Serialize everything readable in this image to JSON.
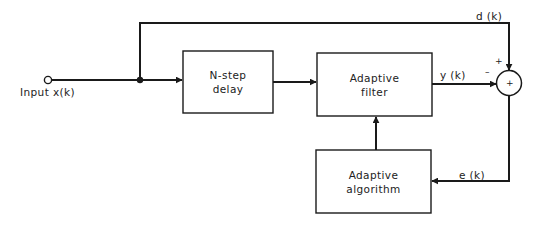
{
  "diagram": {
    "type": "block-diagram",
    "colors": {
      "stroke": "#1a1a1a",
      "background": "#ffffff",
      "text": "#222222"
    },
    "input": {
      "label": "Input x(k)"
    },
    "blocks": [
      {
        "id": "delay",
        "line1": "N-step",
        "line2": "delay"
      },
      {
        "id": "filter",
        "line1": "Adaptive",
        "line2": "filter"
      },
      {
        "id": "algorithm",
        "line1": "Adaptive",
        "line2": "algorithm"
      }
    ],
    "signals": {
      "desired": "d (k)",
      "output": "y (k)",
      "error": "e (k)"
    },
    "summing_junction": {
      "center_symbol": "+",
      "plus_sign": "+",
      "minus_sign": "–"
    },
    "edges": [
      {
        "from": "input",
        "to": "delay"
      },
      {
        "from": "input",
        "to": "summing_junction",
        "label": "d (k)",
        "sign": "+"
      },
      {
        "from": "delay",
        "to": "filter"
      },
      {
        "from": "filter",
        "to": "summing_junction",
        "label": "y (k)",
        "sign": "-"
      },
      {
        "from": "summing_junction",
        "to": "algorithm",
        "label": "e (k)"
      },
      {
        "from": "algorithm",
        "to": "filter"
      }
    ]
  }
}
